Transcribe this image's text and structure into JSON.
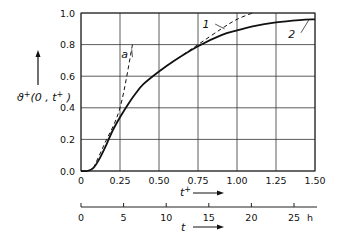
{
  "chart_data": {
    "type": "line",
    "title": "",
    "xlabel": "t+",
    "ylabel": "ϑ+(0, t+)",
    "secondary_xlabel": "t",
    "secondary_x_unit": "h",
    "xlim": [
      0,
      1.5
    ],
    "ylim": [
      0,
      1.0
    ],
    "grid": true,
    "x_ticks": [
      "0",
      "0.25",
      "0.50",
      "0.75",
      "1.00",
      "1.25",
      "1.50"
    ],
    "y_ticks": [
      "0.0",
      "0.2",
      "0.4",
      "0.6",
      "0.8",
      "1.0"
    ],
    "secondary_x_ticks": [
      "0",
      "5",
      "10",
      "15",
      "20",
      "25"
    ],
    "secondary_x_range_h": [
      0,
      27.5
    ],
    "series": [
      {
        "name": "2",
        "style": "solid",
        "x": [
          0,
          0.04,
          0.08,
          0.12,
          0.16,
          0.2,
          0.25,
          0.3,
          0.35,
          0.4,
          0.5,
          0.6,
          0.75,
          0.9,
          1.0,
          1.1,
          1.25,
          1.4,
          1.5
        ],
        "y": [
          0,
          0.0,
          0.02,
          0.08,
          0.16,
          0.25,
          0.34,
          0.42,
          0.49,
          0.55,
          0.63,
          0.7,
          0.79,
          0.86,
          0.89,
          0.915,
          0.94,
          0.955,
          0.96
        ]
      },
      {
        "name": "1",
        "style": "dashed",
        "x": [
          0.4,
          0.5,
          0.6,
          0.75,
          0.9,
          1.0,
          1.1
        ],
        "y": [
          0.55,
          0.63,
          0.7,
          0.8,
          0.9,
          0.96,
          1.0
        ]
      },
      {
        "name": "a",
        "style": "dashed",
        "x": [
          0.08,
          0.15,
          0.25,
          0.33
        ],
        "y": [
          0.02,
          0.17,
          0.4,
          0.8
        ]
      }
    ],
    "annotations": [
      {
        "text": "a",
        "x": 0.31,
        "y": 0.74
      },
      {
        "text": "1",
        "x": 0.83,
        "y": 0.93
      },
      {
        "text": "2",
        "x": 1.38,
        "y": 0.87
      }
    ]
  },
  "labels": {
    "y_axis_main": "ϑ",
    "y_axis_sup": "+",
    "y_axis_args": "(0 , t",
    "y_axis_args_sup": "+",
    "y_axis_close": " )",
    "x_axis_main": "t",
    "x_axis_sup": "+",
    "secondary_x_axis": "t",
    "secondary_unit": "h"
  }
}
